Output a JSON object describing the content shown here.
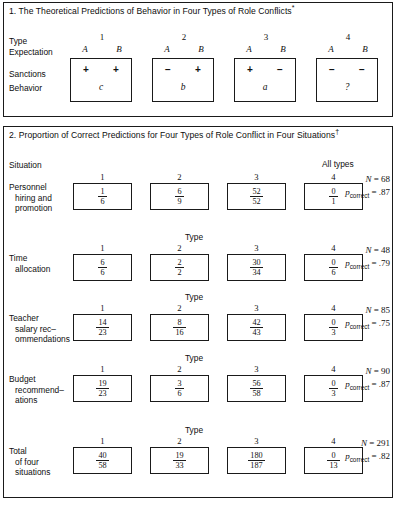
{
  "panel1": {
    "title": "1. The Theoretical Predictions of Behavior in Four Types of Role Conflicts",
    "title_marker": "*",
    "row_labels": {
      "type": "Type",
      "expectation": "Expectation",
      "sanctions": "Sanctions",
      "behavior": "Behavior"
    },
    "types": [
      {
        "number": "1",
        "a_label": "A",
        "b_label": "B",
        "sanction_a": "+",
        "sanction_b": "+",
        "behavior": "c"
      },
      {
        "number": "2",
        "a_label": "A",
        "b_label": "B",
        "sanction_a": "−",
        "sanction_b": "+",
        "behavior": "b"
      },
      {
        "number": "3",
        "a_label": "A",
        "b_label": "B",
        "sanction_a": "+",
        "sanction_b": "−",
        "behavior": "a"
      },
      {
        "number": "4",
        "a_label": "A",
        "b_label": "B",
        "sanction_a": "−",
        "sanction_b": "−",
        "behavior": "?"
      }
    ]
  },
  "panel2": {
    "title": "2. Proportion of Correct Predictions for Four Types of Role Conflict in Four Situations",
    "title_marker": "†",
    "situation_header": "Situation",
    "alltypes_header": "All types",
    "type_header": "Type",
    "column_numbers": [
      "1",
      "2",
      "3",
      "4"
    ],
    "n_symbol": "N",
    "p_symbol": "p",
    "p_subscript": "correct",
    "rows": [
      {
        "label_line1": "Personnel",
        "label_line2": "hiring and",
        "label_line3": "promotion",
        "cells": [
          {
            "num": "1",
            "den": "6"
          },
          {
            "num": "6",
            "den": "9"
          },
          {
            "num": "52",
            "den": "52"
          },
          {
            "num": "0",
            "den": "1"
          }
        ],
        "n_value": "68",
        "p_value": ".87"
      },
      {
        "label_line1": "Time",
        "label_line2": "allocation",
        "label_line3": "",
        "cells": [
          {
            "num": "6",
            "den": "6"
          },
          {
            "num": "2",
            "den": "2"
          },
          {
            "num": "30",
            "den": "34"
          },
          {
            "num": "0",
            "den": "6"
          }
        ],
        "n_value": "48",
        "p_value": ".79"
      },
      {
        "label_line1": "Teacher",
        "label_line2": "salary rec–",
        "label_line3": "ommendations",
        "cells": [
          {
            "num": "14",
            "den": "23"
          },
          {
            "num": "8",
            "den": "16"
          },
          {
            "num": "42",
            "den": "43"
          },
          {
            "num": "0",
            "den": "3"
          }
        ],
        "n_value": "85",
        "p_value": ".75"
      },
      {
        "label_line1": "Budget",
        "label_line2": "recommend–",
        "label_line3": "ations",
        "cells": [
          {
            "num": "19",
            "den": "23"
          },
          {
            "num": "3",
            "den": "6"
          },
          {
            "num": "56",
            "den": "58"
          },
          {
            "num": "0",
            "den": "3"
          }
        ],
        "n_value": "90",
        "p_value": ".87"
      },
      {
        "label_line1": "Total",
        "label_line2": "of four",
        "label_line3": "situations",
        "cells": [
          {
            "num": "40",
            "den": "58"
          },
          {
            "num": "19",
            "den": "33"
          },
          {
            "num": "180",
            "den": "187"
          },
          {
            "num": "0",
            "den": "13"
          }
        ],
        "n_value": "291",
        "p_value": ".82"
      }
    ]
  }
}
